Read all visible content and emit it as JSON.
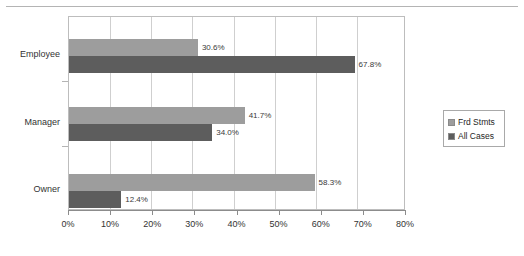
{
  "chart_data": {
    "type": "bar",
    "orientation": "horizontal",
    "title": "",
    "xlabel": "",
    "ylabel": "",
    "categories": [
      "Employee",
      "Manager",
      "Owner"
    ],
    "series": [
      {
        "name": "Frd Stmts",
        "color": "#9d9d9d",
        "values": [
          30.6,
          41.7,
          58.3
        ],
        "labels": [
          "30.6%",
          "41.7%",
          "58.3%"
        ]
      },
      {
        "name": "All Cases",
        "color": "#5d5d5d",
        "values": [
          67.8,
          34.0,
          12.4
        ],
        "labels": [
          "67.8%",
          "34.0%",
          "12.4%"
        ]
      }
    ],
    "xlim": [
      0,
      80
    ],
    "xticks": [
      0,
      10,
      20,
      30,
      40,
      50,
      60,
      70,
      80
    ],
    "xtick_labels": [
      "0%",
      "10%",
      "20%",
      "30%",
      "40%",
      "50%",
      "60%",
      "70%",
      "80%"
    ],
    "grid": "vertical",
    "legend_position": "right",
    "value_labels_shown": true
  },
  "legend": {
    "items": [
      {
        "label": "Frd Stmts",
        "color": "#9d9d9d"
      },
      {
        "label": "All Cases",
        "color": "#5d5d5d"
      }
    ]
  }
}
